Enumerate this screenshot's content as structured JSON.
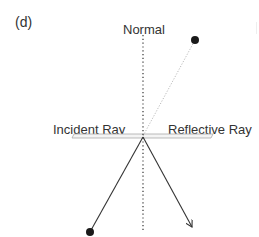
{
  "panel_label": "(d)",
  "labels": {
    "normal": "Normal",
    "incident_ray": "Incident Ray",
    "reflective_ray": "Reflective Ray"
  },
  "colors": {
    "ray": "#333333",
    "normal_dots": "#333333",
    "mirror_stroke": "#aaaaaa",
    "mirror_fill": "#f4f4f4",
    "virtual_ray": "#bbbbbb",
    "endpoint": "#1a1a1a"
  },
  "geometry": {
    "reflection_point": [
      143,
      137
    ],
    "incident_start": [
      90,
      232
    ],
    "reflected_end": [
      192,
      227
    ],
    "virtual_source": [
      195,
      40
    ],
    "normal_top": 35,
    "normal_bottom": 232,
    "mirror": {
      "x1": 72,
      "x2": 213,
      "y": 136
    }
  }
}
